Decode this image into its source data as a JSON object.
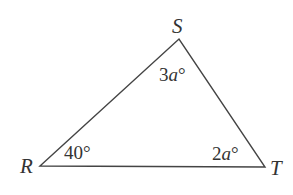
{
  "diagram": {
    "type": "triangle",
    "vertices": [
      {
        "name": "R",
        "label": "R",
        "x": 40,
        "y": 166
      },
      {
        "name": "S",
        "label": "S",
        "x": 179,
        "y": 39
      },
      {
        "name": "T",
        "label": "T",
        "x": 265,
        "y": 167
      }
    ],
    "angles": {
      "R": {
        "num": "40",
        "var": "",
        "deg": "°"
      },
      "S": {
        "num": "3",
        "var": "a",
        "deg": "°"
      },
      "T": {
        "num": "2",
        "var": "a",
        "deg": "°"
      }
    },
    "colors": {
      "stroke": "#444444",
      "text": "#333333",
      "background": "#ffffff"
    }
  }
}
